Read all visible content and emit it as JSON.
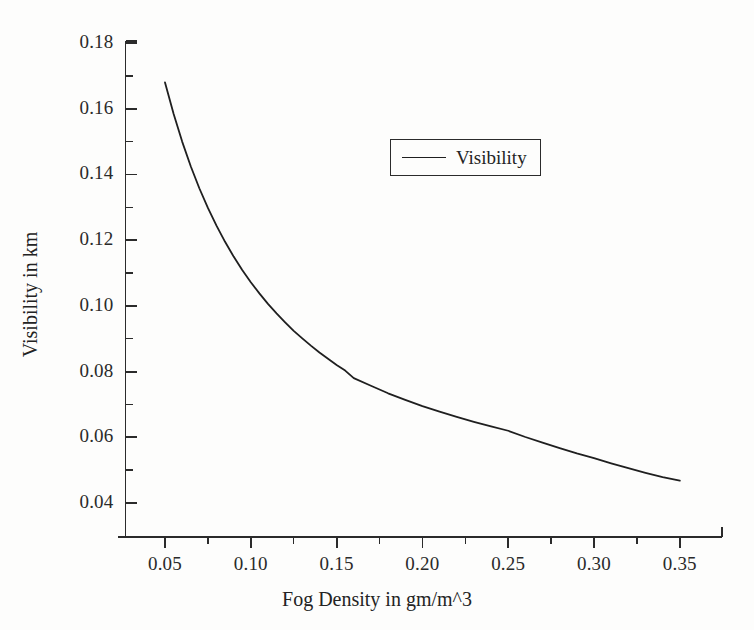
{
  "chart_data": {
    "type": "line",
    "title": "",
    "subtitle": "",
    "xlabel": "Fog Density in gm/m^3",
    "ylabel": "Visibility in km",
    "xlim": [
      0.025,
      0.375
    ],
    "ylim": [
      0.03,
      0.18
    ],
    "grid": false,
    "legend_position": "upper-center-right",
    "x_major_ticks": [
      0.05,
      0.1,
      0.15,
      0.2,
      0.25,
      0.3,
      0.35
    ],
    "x_tick_labels": [
      "0.05",
      "0.10",
      "0.15",
      "0.20",
      "0.25",
      "0.30",
      "0.35"
    ],
    "x_minor_ticks": [
      0.075,
      0.125,
      0.175,
      0.225,
      0.275,
      0.325
    ],
    "y_major_ticks": [
      0.04,
      0.06,
      0.08,
      0.1,
      0.12,
      0.14,
      0.16,
      0.18
    ],
    "y_tick_labels": [
      "0.04",
      "0.06",
      "0.08",
      "0.10",
      "0.12",
      "0.14",
      "0.16",
      "0.18"
    ],
    "y_minor_ticks": [
      0.05,
      0.07,
      0.09,
      0.11,
      0.13,
      0.15,
      0.17
    ],
    "series": [
      {
        "name": "Visibility",
        "color": "#1f1f1f",
        "x": [
          0.05,
          0.055,
          0.06,
          0.065,
          0.07,
          0.075,
          0.08,
          0.085,
          0.09,
          0.095,
          0.1,
          0.105,
          0.11,
          0.115,
          0.12,
          0.125,
          0.13,
          0.135,
          0.14,
          0.145,
          0.15,
          0.155,
          0.16,
          0.17,
          0.18,
          0.19,
          0.2,
          0.21,
          0.22,
          0.23,
          0.24,
          0.25,
          0.26,
          0.27,
          0.28,
          0.29,
          0.3,
          0.31,
          0.32,
          0.33,
          0.34,
          0.35
        ],
        "y": [
          0.168,
          0.1585,
          0.15,
          0.1425,
          0.1358,
          0.1298,
          0.1244,
          0.1195,
          0.115,
          0.1109,
          0.1072,
          0.1038,
          0.1006,
          0.0977,
          0.095,
          0.0924,
          0.0901,
          0.0879,
          0.0858,
          0.0839,
          0.082,
          0.0803,
          0.078,
          0.0757,
          0.0734,
          0.0714,
          0.0695,
          0.0678,
          0.0662,
          0.0647,
          0.0633,
          0.062,
          0.0601,
          0.0584,
          0.0567,
          0.0551,
          0.0537,
          0.0521,
          0.0506,
          0.0492,
          0.0479,
          0.0468
        ]
      }
    ],
    "annotations": []
  },
  "legend": {
    "entries": [
      {
        "label": "Visibility",
        "marker": "line"
      }
    ]
  },
  "axes": {
    "x_title": "Fog Density in gm/m^3",
    "y_title": "Visibility in km"
  },
  "colors": {
    "line": "#1f1f1f",
    "axis": "#2b2b2b",
    "text": "#242424",
    "background": "#fdfdfc"
  }
}
